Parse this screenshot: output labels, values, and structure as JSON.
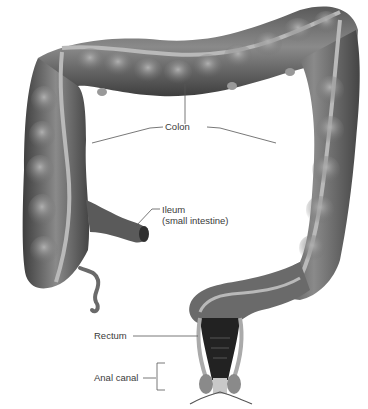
{
  "diagram": {
    "labels": {
      "colon": "Colon",
      "ileum_line1": "Ileum",
      "ileum_line2": "(small intestine)",
      "rectum": "Rectum",
      "anal_canal": "Anal canal"
    },
    "colors": {
      "organ_dark": "#4a4a4a",
      "organ_mid": "#7a7a7a",
      "organ_light": "#a8a8a8",
      "band": "#b9b9b9",
      "leader_line": "#555555",
      "label_text": "#3a3a3a"
    }
  }
}
